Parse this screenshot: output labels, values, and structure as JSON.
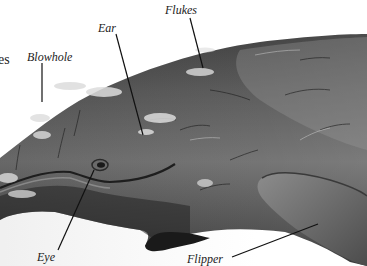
{
  "diagram": {
    "colors": {
      "background": "#ffffff",
      "body_dark": "#2e2e2e",
      "body_mid": "#5a5a5a",
      "body_light": "#8a8a8a",
      "scar": "#d8d8d8",
      "leader_line": "#111111",
      "label_text": "#222222"
    },
    "labels": [
      {
        "id": "partial",
        "text": "es"
      },
      {
        "id": "blowhole",
        "text": "Blowhole"
      },
      {
        "id": "ear",
        "text": "Ear"
      },
      {
        "id": "flukes",
        "text": "Flukes"
      },
      {
        "id": "eye",
        "text": "Eye"
      },
      {
        "id": "flipper",
        "text": "Flipper"
      }
    ]
  }
}
